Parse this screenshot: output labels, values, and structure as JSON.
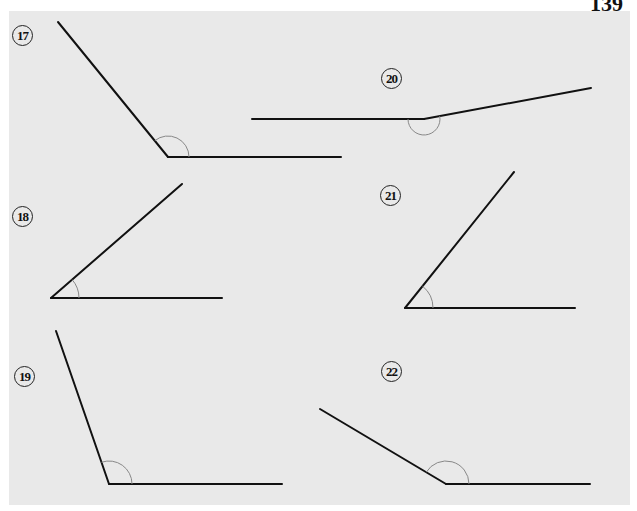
{
  "page": {
    "number": "139"
  },
  "colors": {
    "background": "#e9e9e9",
    "ray": "#111111",
    "arc": "#888888"
  },
  "problems": [
    {
      "id": "17",
      "label": "17",
      "label_pos": [
        12,
        25
      ],
      "vertex": [
        168,
        157
      ],
      "ray1_end": [
        341,
        157
      ],
      "ray2_end": [
        58,
        22
      ],
      "arc_r": 21,
      "kind": "obtuse"
    },
    {
      "id": "18",
      "label": "18",
      "label_pos": [
        12,
        206
      ],
      "vertex": [
        51,
        298
      ],
      "ray1_end": [
        222,
        298
      ],
      "ray2_end": [
        182,
        184
      ],
      "arc_r": 28,
      "kind": "acute"
    },
    {
      "id": "19",
      "label": "19",
      "label_pos": [
        14,
        366
      ],
      "vertex": [
        109,
        484
      ],
      "ray1_end": [
        282,
        484
      ],
      "ray2_end": [
        56,
        331
      ],
      "arc_r": 23,
      "kind": "obtuse"
    },
    {
      "id": "20",
      "label": "20",
      "label_pos": [
        381,
        68
      ],
      "vertex": [
        424,
        119
      ],
      "ray1_end": [
        252,
        119
      ],
      "ray2_end": [
        591,
        88
      ],
      "arc_r": 16,
      "kind": "reflex-straight"
    },
    {
      "id": "21",
      "label": "21",
      "label_pos": [
        380,
        185
      ],
      "vertex": [
        405,
        308
      ],
      "ray1_end": [
        575,
        308
      ],
      "ray2_end": [
        514,
        172
      ],
      "arc_r": 28,
      "kind": "acute"
    },
    {
      "id": "22",
      "label": "22",
      "label_pos": [
        381,
        361
      ],
      "vertex": [
        446,
        484
      ],
      "ray1_end": [
        590,
        484
      ],
      "ray2_end": [
        320,
        409
      ],
      "arc_r": 23,
      "kind": "obtuse"
    }
  ]
}
